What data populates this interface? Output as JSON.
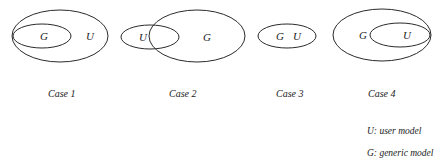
{
  "cases": [
    {
      "label": "Case 1",
      "description": "G contained in U",
      "outer": {
        "name": "U",
        "cx": 60,
        "cy": 36,
        "rx": 48,
        "ry": 26
      },
      "inner": {
        "name": "G",
        "cx": 42,
        "cy": 36,
        "rx": 29,
        "ry": 12
      },
      "text": [
        {
          "t": "G",
          "x": 40,
          "y": 40
        },
        {
          "t": "U",
          "x": 86,
          "y": 40
        }
      ]
    },
    {
      "label": "Case 2",
      "description": "U and G overlap",
      "outer": {
        "name": "G",
        "cx": 197,
        "cy": 36,
        "rx": 48,
        "ry": 26
      },
      "inner": {
        "name": "U",
        "cx": 150,
        "cy": 37,
        "rx": 29,
        "ry": 12
      },
      "text": [
        {
          "t": "U",
          "x": 139,
          "y": 41
        },
        {
          "t": "G",
          "x": 203,
          "y": 41
        }
      ]
    },
    {
      "label": "Case 3",
      "description": "G equals U",
      "outer": {
        "name": "G U",
        "cx": 287,
        "cy": 36,
        "rx": 29,
        "ry": 12
      },
      "inner": null,
      "text": [
        {
          "t": "G",
          "x": 276,
          "y": 40
        },
        {
          "t": "U",
          "x": 293,
          "y": 40
        }
      ]
    },
    {
      "label": "Case 4",
      "description": "U contained in G",
      "outer": {
        "name": "G",
        "cx": 382,
        "cy": 35,
        "rx": 49,
        "ry": 26
      },
      "inner": {
        "name": "U",
        "cx": 400,
        "cy": 35,
        "rx": 30,
        "ry": 12
      },
      "text": [
        {
          "t": "G",
          "x": 359,
          "y": 39
        },
        {
          "t": "U",
          "x": 403,
          "y": 39
        }
      ]
    }
  ],
  "case_labels": {
    "case1": "Case 1",
    "case2": "Case 2",
    "case3": "Case 3",
    "case4": "Case 4"
  },
  "legend": {
    "u": "U: user model",
    "g": "G: generic model"
  },
  "colors": {
    "stroke": "#2a2a2a",
    "text": "#1a1a1a",
    "background": "#ffffff"
  }
}
